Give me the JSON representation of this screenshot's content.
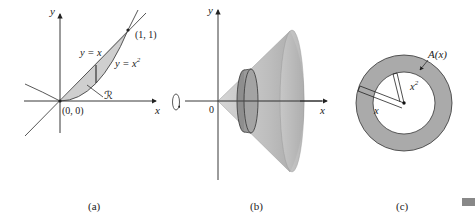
{
  "panel_a": {
    "caption": "(a)",
    "axis_x": "x",
    "axis_y": "y",
    "curve_line": "y = x",
    "curve_parabola": "y = x",
    "parabola_exp": "2",
    "point_top": "(1, 1)",
    "point_origin": "(0, 0)",
    "region": "ℛ"
  },
  "panel_b": {
    "caption": "(b)",
    "axis_x": "x",
    "axis_y": "y",
    "origin": "0"
  },
  "panel_c": {
    "caption": "(c)",
    "area_label": "A(x)",
    "outer_radius": "x",
    "inner_radius": "x",
    "inner_exp": "2"
  },
  "colors": {
    "shade": "#c8c8c8",
    "cone": "#b5b5b5",
    "ring": "#a8a8a8",
    "ink": "#222222"
  }
}
